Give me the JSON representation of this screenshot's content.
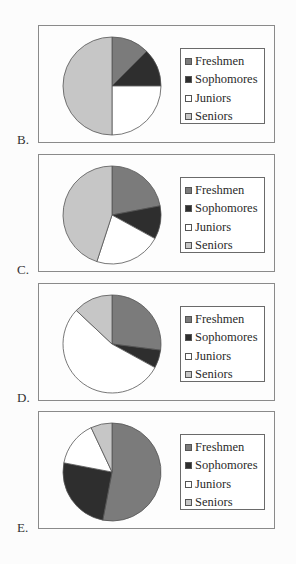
{
  "colors": {
    "Freshmen": "#7b7b7b",
    "Sophomores": "#2e2e2e",
    "Juniors": "#ffffff",
    "Seniors": "#c6c6c6",
    "outline": "#555555"
  },
  "legend": {
    "items": [
      {
        "label": "Freshmen",
        "icon": "medium-gray-square"
      },
      {
        "label": "Sophomores",
        "icon": "dark-square"
      },
      {
        "label": "Juniors",
        "icon": "white-square"
      },
      {
        "label": "Seniors",
        "icon": "light-gray-square"
      }
    ]
  },
  "options": [
    {
      "label": "B."
    },
    {
      "label": "C."
    },
    {
      "label": "D."
    },
    {
      "label": "E."
    }
  ],
  "chart_data": [
    {
      "type": "pie",
      "title": "B.",
      "categories": [
        "Freshmen",
        "Sophomores",
        "Juniors",
        "Seniors"
      ],
      "values": [
        12.5,
        12.5,
        25,
        50
      ],
      "unit": "percent (estimated)",
      "start_angle": "12 o'clock, clockwise",
      "legend_position": "right"
    },
    {
      "type": "pie",
      "title": "C.",
      "categories": [
        "Freshmen",
        "Sophomores",
        "Juniors",
        "Seniors"
      ],
      "values": [
        22,
        11,
        22,
        45
      ],
      "unit": "percent (estimated)",
      "start_angle": "12 o'clock, clockwise",
      "legend_position": "right"
    },
    {
      "type": "pie",
      "title": "D.",
      "categories": [
        "Freshmen",
        "Sophomores",
        "Juniors",
        "Seniors"
      ],
      "values": [
        27,
        6,
        54,
        13
      ],
      "unit": "percent (estimated)",
      "start_angle": "12 o'clock, clockwise",
      "legend_position": "right"
    },
    {
      "type": "pie",
      "title": "E.",
      "categories": [
        "Freshmen",
        "Sophomores",
        "Juniors",
        "Seniors"
      ],
      "values": [
        53,
        25,
        15,
        7
      ],
      "unit": "percent (estimated)",
      "start_angle": "12 o'clock, clockwise",
      "legend_position": "right"
    }
  ]
}
